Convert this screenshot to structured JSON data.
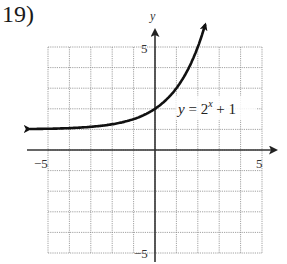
{
  "problem": {
    "number_label": "19)"
  },
  "chart_data": {
    "type": "line",
    "title": "",
    "xlabel": "",
    "ylabel": "y",
    "xlim": [
      -5,
      5
    ],
    "ylim": [
      -5,
      5
    ],
    "grid": true,
    "x_tick_labels": [
      "-5",
      "5"
    ],
    "y_tick_labels": [
      "5",
      "-5"
    ],
    "series": [
      {
        "name": "y = 2^x + 1",
        "function": "2^x + 1",
        "x": [
          -5,
          -4,
          -3,
          -2,
          -1,
          0,
          1,
          2,
          2.3
        ],
        "values": [
          1.03,
          1.06,
          1.13,
          1.25,
          1.5,
          2,
          3,
          5,
          5.9
        ],
        "arrows": "both"
      }
    ],
    "annotations": [
      {
        "text": "y = 2x + 1",
        "display": "y = 2^x + 1",
        "x": 2.5,
        "y": 2
      }
    ]
  },
  "labels": {
    "y_axis": "y",
    "x_min": "−5",
    "x_max": "5",
    "y_max": "5",
    "y_min": "−5",
    "eq_y": "y",
    "eq_equals": " = 2",
    "eq_exp": "x",
    "eq_rest": " + 1"
  }
}
